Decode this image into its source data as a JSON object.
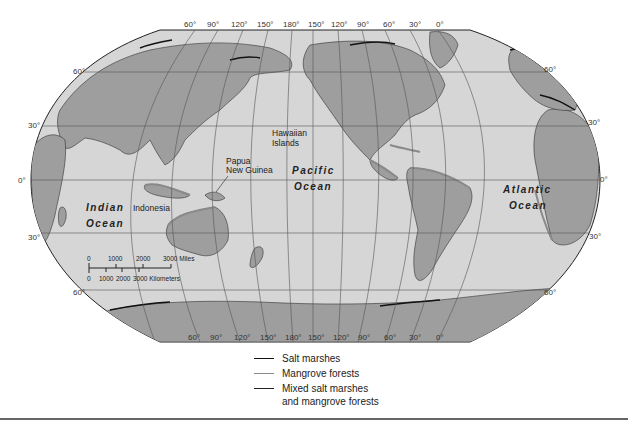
{
  "colors": {
    "ocean": "#d6d6d6",
    "land": "#9e9e9e",
    "salt_marsh": "#111111",
    "mangrove": "#8a8a8a",
    "mixed": "#222222",
    "grid": "#555555"
  },
  "top_longitude_labels": [
    "60°",
    "90°",
    "120°",
    "150°",
    "180°",
    "150°",
    "120°",
    "90°",
    "60°",
    "30°",
    "0°"
  ],
  "bottom_longitude_labels": [
    "60°",
    "90°",
    "120°",
    "150°",
    "180°",
    "150°",
    "120°",
    "90°",
    "60°",
    "30°",
    "0°"
  ],
  "left_latitude_labels": [
    "60°",
    "30°",
    "0°",
    "30°",
    "60°"
  ],
  "right_latitude_labels": [
    "60°",
    "30°",
    "0°",
    "30°",
    "60°"
  ],
  "oceans": {
    "indian": {
      "line1": "Indian",
      "line2": "Ocean"
    },
    "pacific": {
      "line1": "Pacific",
      "line2": "Ocean"
    },
    "atlantic": {
      "line1": "Atlantic",
      "line2": "Ocean"
    }
  },
  "places": {
    "hawaii": {
      "line1": "Hawaiian",
      "line2": "Islands"
    },
    "papua": {
      "line1": "Papua",
      "line2": "New Guinea"
    },
    "indonesia": "Indonesia"
  },
  "scale_bar": {
    "miles": [
      "0",
      "1000",
      "2000",
      "3000 Miles"
    ],
    "km": [
      "0",
      "1000",
      "2000",
      "3000 Kilometers"
    ]
  },
  "legend": [
    {
      "label": "Salt marshes",
      "label2": ""
    },
    {
      "label": "Mangrove forests",
      "label2": ""
    },
    {
      "label": "Mixed salt marshes",
      "label2": "and mangrove forests"
    }
  ]
}
